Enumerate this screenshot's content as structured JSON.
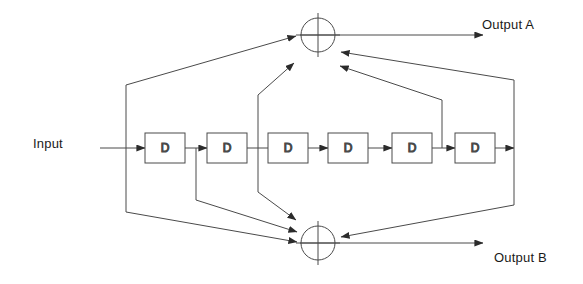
{
  "diagram": {
    "stroke_color": "#3a3a3a",
    "text_color": "#1a1a1a",
    "background": "#ffffff",
    "input": {
      "label": "Input"
    },
    "outputs": [
      {
        "id": "a",
        "label": "Output A"
      },
      {
        "id": "b",
        "label": "Output B"
      }
    ],
    "registers": [
      {
        "index": 0,
        "label": "D",
        "x": 145,
        "y": 133,
        "w": 40,
        "h": 30
      },
      {
        "index": 1,
        "label": "D",
        "x": 207,
        "y": 133,
        "w": 40,
        "h": 30
      },
      {
        "index": 2,
        "label": "D",
        "x": 268,
        "y": 133,
        "w": 40,
        "h": 30
      },
      {
        "index": 3,
        "label": "D",
        "x": 328,
        "y": 133,
        "w": 40,
        "h": 30
      },
      {
        "index": 4,
        "label": "D",
        "x": 392,
        "y": 133,
        "w": 40,
        "h": 30
      },
      {
        "index": 5,
        "label": "D",
        "x": 455,
        "y": 133,
        "w": 40,
        "h": 30
      }
    ],
    "adders": [
      {
        "id": "xor-top",
        "label": "",
        "cx": 318,
        "cy": 35,
        "r": 17
      },
      {
        "id": "xor-bottom",
        "label": "",
        "cx": 318,
        "cy": 243,
        "r": 17
      }
    ]
  }
}
